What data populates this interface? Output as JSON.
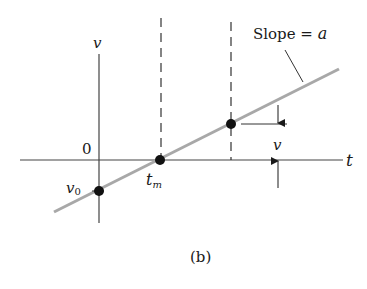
{
  "diagram": {
    "caption": "(b)",
    "axes": {
      "x_label": "t",
      "y_label": "v",
      "origin_label": "0"
    },
    "line": {
      "label_text": "Slope = ",
      "label_var": "a",
      "color": "#a8a8a8"
    },
    "points": [
      {
        "name": "v0",
        "label": "v",
        "subscript": "0"
      },
      {
        "name": "tm",
        "label": "t",
        "subscript": "m"
      },
      {
        "name": "p",
        "label": ""
      }
    ],
    "dimension": {
      "label": "v"
    }
  }
}
